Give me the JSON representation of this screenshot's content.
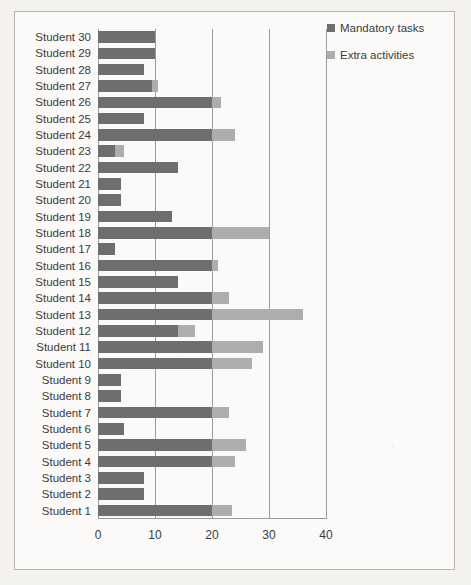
{
  "chart_data": {
    "type": "bar",
    "orientation": "horizontal",
    "stacked": true,
    "title": "",
    "xlabel": "",
    "ylabel": "",
    "xlim": [
      0,
      40
    ],
    "xticks": [
      0,
      10,
      20,
      30,
      40
    ],
    "xtick_labels": [
      "0",
      "10",
      "20",
      "30",
      "40"
    ],
    "grid": true,
    "grid_axis": "x",
    "legend_position": "top-right",
    "categories": [
      "Student 30",
      "Student 29",
      "Student 28",
      "Student 27",
      "Student 26",
      "Student 25",
      "Student 24",
      "Student 23",
      "Student 22",
      "Student 21",
      "Student 20",
      "Student 19",
      "Student 18",
      "Student 17",
      "Student 16",
      "Student 15",
      "Student 14",
      "Student 13",
      "Student 12",
      "Student 11",
      "Student 10",
      "Student 9",
      "Student 8",
      "Student 7",
      "Student 6",
      "Student 5",
      "Student 4",
      "Student 3",
      "Student 2",
      "Student 1"
    ],
    "series": [
      {
        "name": "Mandatory tasks",
        "color": "#6e6e6e",
        "values": [
          10,
          10,
          8,
          9.5,
          20,
          8,
          20,
          3,
          14,
          4,
          4,
          13,
          20,
          3,
          20,
          14,
          20,
          20,
          14,
          20,
          20,
          4,
          4,
          20,
          4.5,
          20,
          20,
          8,
          8,
          20
        ]
      },
      {
        "name": "Extra activities",
        "color": "#adadad",
        "values": [
          0,
          0,
          0,
          1,
          1.5,
          0,
          4,
          1.5,
          0,
          0,
          0,
          0,
          10,
          0,
          1,
          0,
          3,
          16,
          3,
          9,
          7,
          0,
          0,
          3,
          0,
          6,
          4,
          0,
          0,
          3.5
        ]
      }
    ],
    "totals": [
      10,
      10,
      8,
      10.5,
      21.5,
      8,
      24,
      4.5,
      14,
      4,
      4,
      13,
      30,
      3,
      21,
      14,
      23,
      36,
      17,
      29,
      27,
      4,
      4,
      23,
      4.5,
      26,
      24,
      8,
      8,
      23.5
    ]
  },
  "legend": {
    "items": [
      {
        "label": "Mandatory tasks",
        "color": "#6e6e6e",
        "swatch_name": "legend-swatch-mandatory"
      },
      {
        "label": "Extra activities",
        "color": "#adadad",
        "swatch_name": "legend-swatch-extra"
      }
    ]
  },
  "colors": {
    "series_dark": "#6e6e6e",
    "series_light": "#adadad",
    "gridline": "#9b9b9b",
    "frame_border": "#b9b5ae",
    "plot_background": "#fbfaf8",
    "page_background": "#f4f2ef",
    "text": "#3b3b3b"
  }
}
